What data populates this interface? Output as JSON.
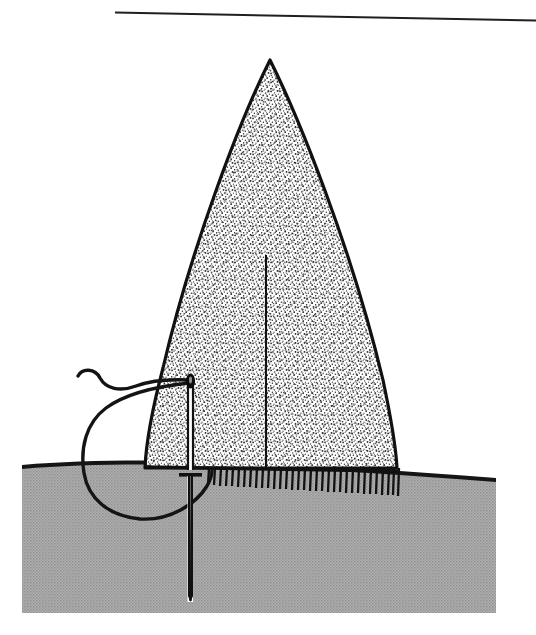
{
  "figure": {
    "kind": "line-art-illustration",
    "background_color": "#ffffff",
    "width": 536,
    "height": 635,
    "alt_text": "Black and white medical line drawing: a tall pointed stippled body rises from a gray hatched tissue bed; a straight suture needle with a threaded eye pierces the bed, its thread looping below the surface."
  },
  "rule": {
    "name": "top-divider-rule",
    "x1": 115,
    "y1": 11,
    "x2": 536,
    "y2": 19,
    "color": "#1a1a1a",
    "thickness": 2
  },
  "ground": {
    "name": "tissue-bed",
    "fill_color": "#a8a8a8",
    "stipple_color": "#9a9a9a",
    "outline_color": "#111111",
    "left": 22,
    "right": 496,
    "top_left_y": 466,
    "top_right_y": 479,
    "bottom_y": 613,
    "surface_arc_peak_y": 461
  },
  "pointed_body": {
    "name": "stippled-pointed-structure",
    "fill_color": "#ffffff",
    "stipple_color": "#303030",
    "outline_color": "#101010",
    "apex_x": 270,
    "apex_y": 60,
    "base_left_x": 145,
    "base_right_x": 397,
    "base_y": 468,
    "midline": {
      "x": 266,
      "top_y": 255,
      "bottom_y": 468,
      "color": "#111111"
    }
  },
  "hatching": {
    "name": "tissue-edge-hatch-marks",
    "start_x": 208,
    "end_x": 400,
    "count": 33,
    "length": 17,
    "color": "#111111"
  },
  "needle": {
    "name": "suture-needle",
    "shaft_x": 190,
    "eye_y": 378,
    "crossbar_y": 475,
    "crossbar_half_width": 11,
    "tip_y": 602,
    "shaft_color": "#111111",
    "shaft_fill": "#ffffff",
    "eye_color": "#000000"
  },
  "thread": {
    "name": "suture-thread",
    "color": "#141414",
    "thickness": 3.4,
    "tail_start_x": 78,
    "tail_start_y": 377,
    "loop_bottom_y": 517,
    "loop_left_x": 84,
    "return_x": 212,
    "return_y": 470
  },
  "palette": {
    "ink": "#111111",
    "tissue_gray": "#a8a8a8",
    "paper": "#ffffff"
  }
}
